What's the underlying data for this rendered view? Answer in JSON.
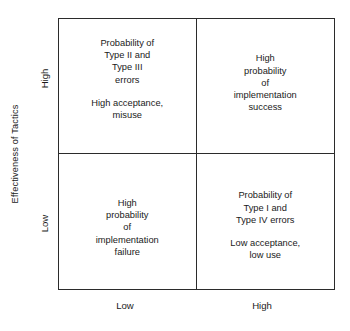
{
  "figure": {
    "type": "2x2-matrix",
    "background_color": "#ffffff",
    "line_color": "#2b2b2b",
    "text_color": "#1a1a1a"
  },
  "y_axis": {
    "title": "Effectiveness of Tactics",
    "ticks": [
      {
        "label": "High",
        "position": "top"
      },
      {
        "label": "Low",
        "position": "bottom"
      }
    ]
  },
  "x_axis": {
    "title": "",
    "ticks": [
      {
        "label": "Low",
        "position": "left"
      },
      {
        "label": "High",
        "position": "right"
      }
    ]
  },
  "quadrants": {
    "top_left": {
      "blocks": [
        "Probability of\nType II and\nType III\nerrors",
        "High acceptance,\nmisuse"
      ]
    },
    "top_right": {
      "blocks": [
        "High\nprobability\nof\nimplementation\nsuccess"
      ]
    },
    "bottom_left": {
      "blocks": [
        "High\nprobability\nof\nimplementation\nfailure"
      ]
    },
    "bottom_right": {
      "blocks": [
        "Probability of\nType I and\nType IV errors",
        "Low acceptance,\nlow use"
      ]
    }
  }
}
